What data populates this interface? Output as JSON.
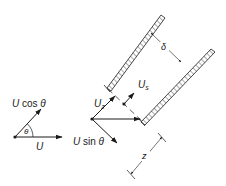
{
  "figure": {
    "background": "#ffffff",
    "stroke_color": "#1a1a1a",
    "labels": {
      "u_cos_theta": {
        "var": "U",
        "func": "cos",
        "angle": "θ"
      },
      "theta": "θ",
      "u": "U",
      "u_z": {
        "var": "U",
        "sub": "z"
      },
      "u_sin_theta": {
        "var": "U",
        "func": "sin",
        "angle": "θ"
      },
      "u_s": {
        "var": "U",
        "sub": "s"
      },
      "delta": "δ",
      "z": "z"
    },
    "components": {
      "left_vector_diagram": "Velocity U decomposed with component U cos θ at angle θ",
      "middle_vector_diagram": "Velocity components U_z and U sin θ",
      "channel": "Inclined parallel hatched walls separated by δ, with slip velocity U_s and length z"
    }
  }
}
